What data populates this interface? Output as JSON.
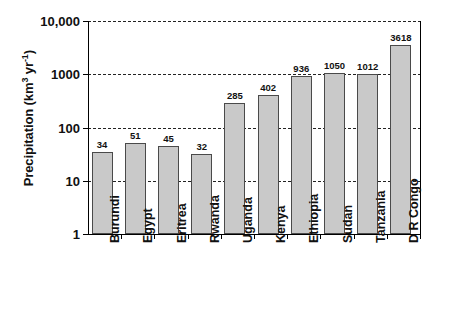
{
  "chart_data": {
    "type": "bar",
    "title": "",
    "xlabel": "",
    "ylabel": "Precipitation (km3 yr-1)",
    "ylabel_parts": {
      "main": "Precipitation (km",
      "sup1": "3",
      "mid": " yr",
      "sup2": "-1",
      "tail": ")"
    },
    "yscale": "log",
    "ylim": [
      1,
      10000
    ],
    "ytick_labels": [
      "10,000",
      "1000",
      "100",
      "10",
      "1"
    ],
    "ytick_values": [
      10000,
      1000,
      100,
      10,
      1
    ],
    "grid": "horizontal-dashed",
    "legend": "none",
    "categories": [
      "Burundi",
      "Egypt",
      "Eritrea",
      "Rwanda",
      "Uganda",
      "Kenya",
      "Ethiopia",
      "Sudan",
      "Tanzania",
      "D R Congo"
    ],
    "values": [
      34,
      51,
      45,
      32,
      285,
      402,
      936,
      1050,
      1012,
      3618
    ],
    "value_labels": [
      "34",
      "51",
      "45",
      "32",
      "285",
      "402",
      "936",
      "1050",
      "1012",
      "3618"
    ],
    "bar_color": "#c9c9c9",
    "bar_edge_color": "#4a4a4a",
    "axis_color": "#000000",
    "gridline_color": "#222222",
    "background": "#ffffff"
  }
}
